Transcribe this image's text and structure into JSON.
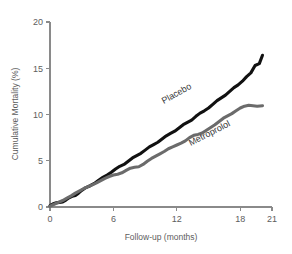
{
  "chart_data": {
    "type": "line",
    "title": "",
    "xlabel": "Follow-up (months)",
    "ylabel": "Cumulative Mortality (%)",
    "xlim": [
      0,
      21
    ],
    "ylim": [
      0,
      20
    ],
    "xticks": [
      0,
      6,
      12,
      18,
      21
    ],
    "yticks": [
      0,
      5,
      10,
      15,
      20
    ],
    "xtick_labels": [
      "0",
      "6",
      "12",
      "18",
      "21"
    ],
    "ytick_labels": [
      "0",
      "5",
      "10",
      "15",
      "20"
    ],
    "grid": false,
    "legend_position": "inline-curve-labels",
    "series": [
      {
        "name": "Placebo",
        "color": "#111111",
        "line_width": 3.1,
        "label_x": 12.1,
        "label_y": 12.0,
        "label_rotation": -29,
        "x": [
          0.0,
          0.3,
          0.6,
          0.9,
          1.2,
          1.5,
          1.8,
          2.1,
          2.4,
          2.7,
          3.0,
          3.4,
          3.8,
          4.2,
          4.6,
          5.0,
          5.4,
          5.8,
          6.2,
          6.6,
          7.0,
          7.4,
          7.8,
          8.2,
          8.6,
          9.0,
          9.4,
          9.8,
          10.2,
          10.6,
          11.0,
          11.4,
          11.8,
          12.2,
          12.6,
          13.0,
          13.4,
          13.8,
          14.2,
          14.6,
          15.0,
          15.4,
          15.8,
          16.2,
          16.6,
          17.0,
          17.4,
          17.8,
          18.2,
          18.6,
          19.0,
          19.4,
          19.8,
          20.1
        ],
        "y": [
          0.15,
          0.35,
          0.45,
          0.5,
          0.55,
          0.75,
          1.0,
          1.15,
          1.25,
          1.5,
          1.8,
          2.1,
          2.3,
          2.55,
          2.9,
          3.2,
          3.45,
          3.75,
          4.1,
          4.4,
          4.6,
          4.95,
          5.3,
          5.55,
          5.8,
          6.15,
          6.5,
          6.75,
          7.0,
          7.35,
          7.7,
          7.95,
          8.2,
          8.55,
          8.9,
          9.15,
          9.4,
          9.8,
          10.15,
          10.4,
          10.7,
          11.1,
          11.5,
          11.8,
          12.1,
          12.5,
          12.9,
          13.2,
          13.6,
          14.1,
          14.5,
          15.3,
          15.5,
          16.4
        ]
      },
      {
        "name": "Metroprolol",
        "color": "#6b6b6b",
        "line_width": 3.1,
        "label_x": 15.2,
        "label_y": 7.7,
        "label_rotation": -27,
        "x": [
          0.0,
          0.4,
          0.8,
          1.2,
          1.6,
          2.0,
          2.4,
          2.8,
          3.2,
          3.6,
          4.0,
          4.4,
          4.8,
          5.2,
          5.6,
          6.0,
          6.4,
          6.8,
          7.2,
          7.6,
          8.0,
          8.4,
          8.8,
          9.2,
          9.6,
          10.0,
          10.4,
          10.8,
          11.2,
          11.6,
          12.0,
          12.4,
          12.8,
          13.2,
          13.6,
          14.0,
          14.4,
          14.8,
          15.2,
          15.6,
          16.0,
          16.4,
          16.8,
          17.2,
          17.6,
          18.0,
          18.4,
          18.8,
          19.2,
          19.6,
          20.1
        ],
        "y": [
          0.1,
          0.3,
          0.5,
          0.7,
          0.95,
          1.2,
          1.5,
          1.75,
          2.0,
          2.2,
          2.4,
          2.6,
          2.85,
          3.1,
          3.3,
          3.45,
          3.55,
          3.7,
          3.95,
          4.2,
          4.3,
          4.35,
          4.6,
          4.95,
          5.25,
          5.5,
          5.75,
          6.0,
          6.3,
          6.5,
          6.7,
          6.9,
          7.15,
          7.5,
          7.75,
          7.85,
          8.0,
          8.3,
          8.6,
          8.9,
          9.25,
          9.6,
          9.85,
          10.1,
          10.4,
          10.7,
          10.9,
          11.0,
          10.95,
          10.9,
          10.95
        ]
      }
    ]
  }
}
